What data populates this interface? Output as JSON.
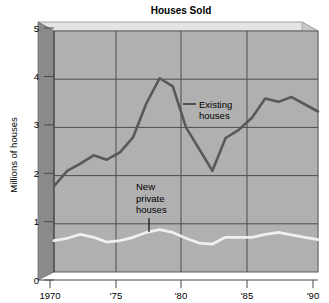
{
  "chart_data": {
    "type": "line",
    "title": "Houses Sold",
    "xlabel": "",
    "ylabel": "Millions of houses",
    "xlim": [
      1970,
      1990
    ],
    "ylim": [
      0,
      5
    ],
    "grid": true,
    "legend_position": "inline-annotation",
    "x_tick_labels": [
      "1970",
      "'75",
      "'80",
      "'85",
      "'90"
    ],
    "x_tick_values": [
      1970,
      1975,
      1980,
      1985,
      1990
    ],
    "y_tick_labels": [
      "0",
      "1",
      "2",
      "3",
      "4",
      "5"
    ],
    "y_tick_values": [
      0,
      1,
      2,
      3,
      4,
      5
    ],
    "x": [
      1970,
      1971,
      1972,
      1973,
      1974,
      1975,
      1976,
      1977,
      1978,
      1979,
      1980,
      1981,
      1982,
      1983,
      1984,
      1985,
      1986,
      1987,
      1988,
      1989,
      1990
    ],
    "series": [
      {
        "name": "Existing houses",
        "color": "#595959",
        "values": [
          1.78,
          2.1,
          2.25,
          2.42,
          2.33,
          2.48,
          2.8,
          3.5,
          4.02,
          3.85,
          3.0,
          2.55,
          2.1,
          2.78,
          2.95,
          3.2,
          3.6,
          3.53,
          3.63,
          3.48,
          3.33
        ]
      },
      {
        "name": "New private houses",
        "color": "#f0f0f0",
        "values": [
          0.65,
          0.7,
          0.78,
          0.72,
          0.62,
          0.65,
          0.72,
          0.82,
          0.88,
          0.82,
          0.7,
          0.6,
          0.58,
          0.72,
          0.72,
          0.72,
          0.78,
          0.82,
          0.77,
          0.72,
          0.67
        ]
      }
    ],
    "annotations": [
      {
        "text_lines": [
          "Existing",
          "houses"
        ],
        "target_year": 1980,
        "target_value": 3.55
      },
      {
        "text_lines": [
          "New",
          "private",
          "houses"
        ],
        "target_year": 1977.5,
        "target_value": 0.9
      }
    ]
  },
  "colors": {
    "plot_background": "#b0b0b0",
    "box_left_face": "#8a8a8a",
    "box_top_face": "#e4e4e4",
    "gridline": "#4d4d4d",
    "axis": "#555555",
    "existing_line": "#595959",
    "new_line": "#f0f0f0",
    "text": "#000000",
    "page_background": "#ffffff"
  }
}
